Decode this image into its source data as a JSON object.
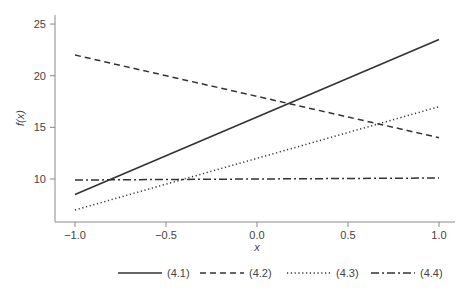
{
  "chart_data": {
    "type": "line",
    "title": "",
    "xlabel": "x",
    "ylabel": "f(x)",
    "xlim": [
      -1.1,
      1.05
    ],
    "ylim": [
      6.0,
      26.0
    ],
    "x": [
      -1.0,
      1.0
    ],
    "xticks": [
      "-1.0",
      "-0.5",
      "0.0",
      "0.5",
      "1.0"
    ],
    "yticks": [
      "10",
      "15",
      "20",
      "25"
    ],
    "grid": false,
    "legend_position": "bottom",
    "series": [
      {
        "name": "(4.1)",
        "style": "solid",
        "values": [
          8.5,
          23.5
        ]
      },
      {
        "name": "(4.2)",
        "style": "dashed",
        "values": [
          22.0,
          14.0
        ]
      },
      {
        "name": "(4.3)",
        "style": "dotted",
        "values": [
          7.0,
          17.0
        ]
      },
      {
        "name": "(4.4)",
        "style": "dashdot",
        "values": [
          9.9,
          10.1
        ]
      }
    ]
  },
  "colors": {
    "line": "#333333",
    "axis": "#888888",
    "text": "#444444"
  }
}
